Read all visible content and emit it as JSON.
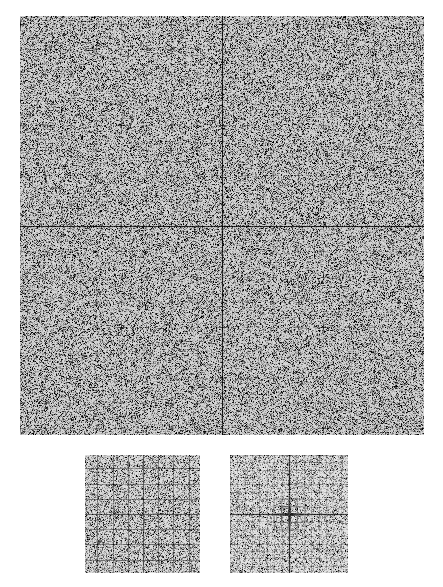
{
  "figure": {
    "title": "",
    "background_color": "#ffffff",
    "ink_color": "#000000",
    "width": 443,
    "height": 587,
    "caption": ""
  },
  "chart_data": {
    "type": "heatmap",
    "title": "",
    "subtitle": "",
    "xlabel": "",
    "ylabel": "",
    "grid": false,
    "legend_position": "none",
    "colormap": "grayscale",
    "value_range": [
      0,
      1
    ],
    "description": "Grayscale magnitude field rendered as dense pixel noise with darker cross-shaped features arranged on a regular lattice; strong horizontal and vertical axes through the centre.",
    "panels": [
      {
        "name": "main-spectrum",
        "role": "full-field",
        "x": 20,
        "y": 16,
        "width": 404,
        "height": 419,
        "center": [
          222,
          225
        ],
        "xlim": [
          -1,
          1
        ],
        "ylim": [
          -1,
          1
        ],
        "xticklabels": [],
        "yticklabels": [],
        "lattice_spacing_px": 25.3,
        "axis_line_strength": 0.95,
        "lattice_cross_strength": 0.55,
        "noise_floor": 0.16,
        "noise_contrast": 0.34,
        "cross_arm_px": 6,
        "major_lattice_every": 4,
        "major_cross_strength": 0.8,
        "major_cross_arm_px": 9
      },
      {
        "name": "detail-left",
        "role": "zoom-inset-grid",
        "x": 85,
        "y": 455,
        "width": 115,
        "height": 118,
        "center": [
          142,
          513
        ],
        "xlim": [
          -0.25,
          0.25
        ],
        "ylim": [
          -0.25,
          0.25
        ],
        "xticklabels": [],
        "yticklabels": [],
        "lattice_spacing_px": 15.2,
        "axis_line_strength": 0.7,
        "lattice_cross_strength": 0.62,
        "noise_floor": 0.13,
        "noise_contrast": 0.3,
        "cross_arm_px": 8,
        "major_lattice_every": 1,
        "major_cross_strength": 0.7,
        "major_cross_arm_px": 8,
        "continuous_lines": true
      },
      {
        "name": "detail-right",
        "role": "zoom-inset-centre",
        "x": 230,
        "y": 455,
        "width": 118,
        "height": 118,
        "center": [
          289,
          513
        ],
        "xlim": [
          -0.12,
          0.12
        ],
        "ylim": [
          -0.12,
          0.12
        ],
        "xticklabels": [],
        "yticklabels": [],
        "lattice_spacing_px": 7.4,
        "axis_line_strength": 0.85,
        "lattice_cross_strength": 0.5,
        "noise_floor": 0.1,
        "noise_contrast": 0.26,
        "cross_arm_px": 3,
        "major_lattice_every": 4,
        "major_cross_strength": 0.75,
        "major_cross_arm_px": 5,
        "central_blob_radius_px": 24,
        "central_blob_strength": 0.9
      }
    ],
    "series": [
      {
        "name": "axis-horizontal",
        "values": [
          1.0
        ],
        "note": "bright horizontal line through panel centre"
      },
      {
        "name": "axis-vertical",
        "values": [
          1.0
        ],
        "note": "bright vertical line through panel centre"
      },
      {
        "name": "lattice-peaks",
        "values": [
          0.55
        ],
        "note": "cross-shaped peaks on a regular square lattice"
      },
      {
        "name": "background-noise",
        "values": [
          0.16
        ],
        "note": "uniform speckle floor"
      }
    ]
  }
}
